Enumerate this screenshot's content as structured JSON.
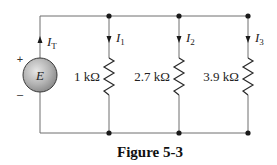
{
  "figure": {
    "caption": "Figure 5-3",
    "type": "parallel resistor circuit"
  },
  "source": {
    "label": "E",
    "plus": "+",
    "minus": "–",
    "current_label": "I",
    "current_sub": "T"
  },
  "branches": [
    {
      "current_label": "I",
      "current_sub": "1",
      "resistance": "1 kΩ"
    },
    {
      "current_label": "I",
      "current_sub": "2",
      "resistance": "2.7 kΩ"
    },
    {
      "current_label": "I",
      "current_sub": "3",
      "resistance": "3.9 kΩ"
    }
  ],
  "colors": {
    "wire": "#6f6f6f",
    "source_fill_light": "#d8d8d8",
    "source_fill_dark": "#8a8a8a",
    "node": "#1a1a1a"
  }
}
